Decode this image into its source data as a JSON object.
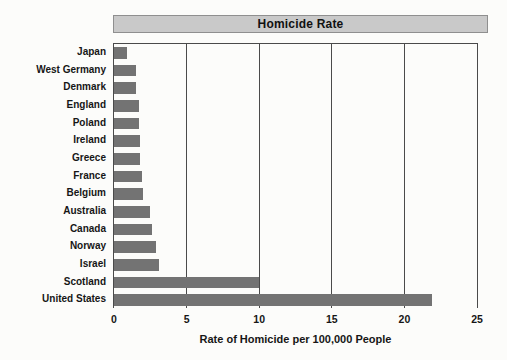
{
  "chart_data": {
    "type": "bar",
    "orientation": "horizontal",
    "title": "Homicide Rate",
    "xlabel": "Rate of Homicide per 100,000 People",
    "ylabel": "",
    "categories": [
      "Japan",
      "West Germany",
      "Denmark",
      "England",
      "Poland",
      "Ireland",
      "Greece",
      "France",
      "Belgium",
      "Australia",
      "Canada",
      "Norway",
      "Israel",
      "Scotland",
      "United States"
    ],
    "values": [
      0.9,
      1.5,
      1.5,
      1.7,
      1.7,
      1.8,
      1.8,
      1.9,
      2.0,
      2.5,
      2.6,
      2.9,
      3.1,
      10.0,
      21.9
    ],
    "xlim": [
      0,
      25
    ],
    "xticks": [
      0,
      5,
      10,
      15,
      20,
      25
    ],
    "grid": "vertical-only",
    "legend": "none",
    "colors": {
      "bar": "#737373",
      "title_band_fill": "#c9c9c9",
      "title_band_border": "#8f8f8f",
      "axis_line": "#4a4a4a",
      "text": "#161616",
      "background": "#fcfcfa"
    }
  }
}
